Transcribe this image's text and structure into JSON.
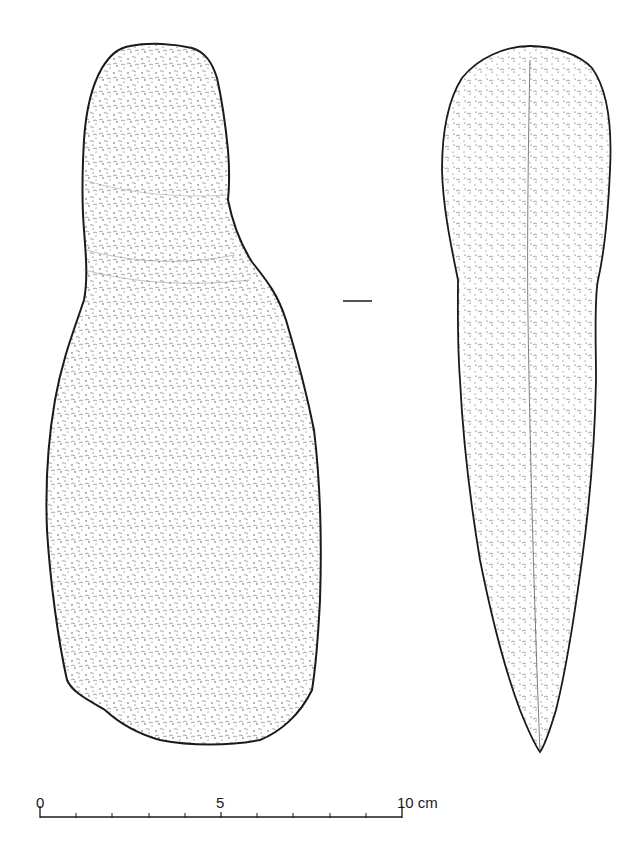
{
  "figure": {
    "type": "archaeological line drawing",
    "views": [
      {
        "name": "face-view",
        "description": "flat face view with waisted neck"
      },
      {
        "name": "profile-view",
        "description": "side/profile view tapering to point"
      }
    ],
    "section_marker": "—",
    "colors": {
      "ink": "#1a1a1a",
      "background": "#ffffff",
      "stipple": "#333333"
    }
  },
  "scale_bar": {
    "labels": [
      "0",
      "5",
      "10 cm"
    ],
    "min": 0,
    "max": 10,
    "unit": "cm",
    "divisions": 10
  }
}
